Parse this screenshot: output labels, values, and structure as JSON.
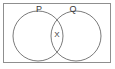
{
  "figure": {
    "type": "venn-diagram",
    "title": "",
    "background_color": "#ffffff",
    "frame": {
      "visible": true,
      "stroke_color": "#8f8f8f",
      "fill_color": "#ffffff"
    },
    "stroke_color": "#6b6b6b",
    "label_color": "#3a3a3a",
    "sets": [
      {
        "id": "set-p",
        "label": "P",
        "label_x": 39,
        "label_y": 10,
        "cx": 38,
        "cy": 36,
        "r": 25
      },
      {
        "id": "set-q",
        "label": "Q",
        "label_x": 73,
        "label_y": 10,
        "cx": 76,
        "cy": 36,
        "r": 25
      }
    ],
    "regions": [
      {
        "id": "region-intersection",
        "label": "X",
        "label_x": 57,
        "label_y": 35,
        "description": "intersection of P and Q"
      }
    ]
  }
}
